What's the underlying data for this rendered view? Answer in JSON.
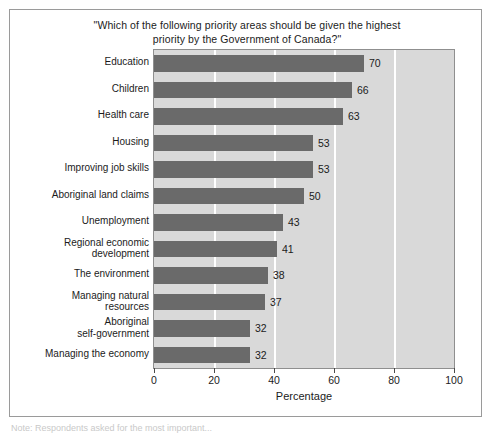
{
  "figure": {
    "title": "\"Which of the following priority areas should be given the highest priority by the Government of Canada?\"",
    "caption": "Note: Respondents asked for the most important..."
  },
  "chart_data": {
    "type": "bar",
    "orientation": "horizontal",
    "title": "\"Which of the following priority areas should be given the highest priority by the Government of Canada?\"",
    "xlabel": "Percentage",
    "ylabel": "",
    "xlim": [
      0,
      100
    ],
    "xticks": [
      0,
      20,
      40,
      60,
      80,
      100
    ],
    "xticklabels": [
      "0",
      "20",
      "40",
      "60",
      "80",
      "100"
    ],
    "grid": "vertical-white",
    "legend": "none",
    "bar_color": "#6a6a6a",
    "plot_background": "#d9d9d9",
    "categories": [
      "Education",
      "Children",
      "Health care",
      "Housing",
      "Improving job skills",
      "Aboriginal land claims",
      "Unemployment",
      "Regional economic\ndevelopment",
      "The environment",
      "Managing natural\nresources",
      "Aboriginal\nself-government",
      "Managing the economy"
    ],
    "values": [
      70,
      66,
      63,
      53,
      53,
      50,
      43,
      41,
      38,
      37,
      32,
      32
    ],
    "value_labels": [
      "70",
      "66",
      "63",
      "53",
      "53",
      "50",
      "43",
      "41",
      "38",
      "37",
      "32",
      "32"
    ]
  }
}
